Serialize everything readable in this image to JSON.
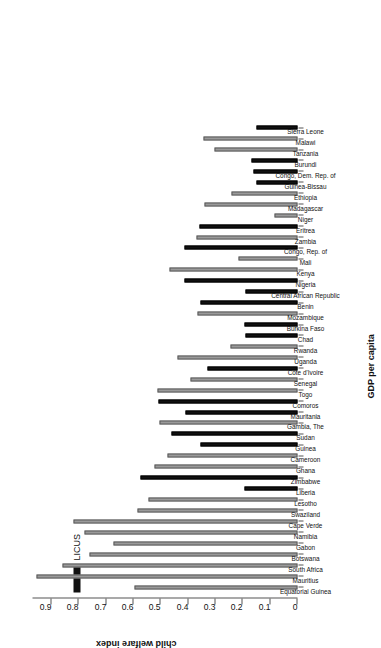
{
  "chart_data": {
    "type": "bar",
    "title": "",
    "xlabel": "GDP per capita",
    "ylabel": "child welfare index",
    "orientation": "vertical-bars-rotated-90",
    "ylim": [
      0,
      0.97
    ],
    "yticks": [
      "0",
      "0.1",
      "0.2",
      "0.3",
      "0.4",
      "0.5",
      "0.6",
      "0.7",
      "0.8",
      "0.9"
    ],
    "ytick_values": [
      0,
      0.1,
      0.2,
      0.3,
      0.4,
      0.5,
      0.6,
      0.7,
      0.8,
      0.9
    ],
    "grid": false,
    "legend": {
      "position": "bottom-right",
      "entries": [
        {
          "label": "LICUS",
          "color": "#111111"
        }
      ]
    },
    "colors": {
      "normal_bar": "#9a9a9a",
      "licus_bar": "#111111",
      "axis": "#555555",
      "text": "#111111"
    },
    "categories": [
      "Equatorial Guinea",
      "Mauritius",
      "South Africa",
      "Botswana",
      "Gabon",
      "Namibia",
      "Cape Verde",
      "Swaziland",
      "Lesotho",
      "Liberia",
      "Zimbabwe",
      "Ghana",
      "Cameroon",
      "Guinea",
      "Sudan",
      "Gambia, The",
      "Mauritania",
      "Comoros",
      "Togo",
      "Senegal",
      "Cote d'Ivoire",
      "Uganda",
      "Rwanda",
      "Chad",
      "Burkina Faso",
      "Mozambique",
      "Benin",
      "Central African Republic",
      "Nigeria",
      "Kenya",
      "Mali",
      "Congo, Rep. of",
      "Zambia",
      "Eritrea",
      "Niger",
      "Madagascar",
      "Ethiopia",
      "Guinea-Bissau",
      "Congo, Dem. Rep. of",
      "Burundi",
      "Tanzania",
      "Malawi",
      "Sierra Leone"
    ],
    "values": [
      0.595,
      0.955,
      0.86,
      0.76,
      0.675,
      0.78,
      0.82,
      0.585,
      0.545,
      0.195,
      0.575,
      0.525,
      0.475,
      0.355,
      0.46,
      0.505,
      0.41,
      0.508,
      0.513,
      0.39,
      0.33,
      0.44,
      0.245,
      0.19,
      0.195,
      0.365,
      0.355,
      0.192,
      0.415,
      0.47,
      0.215,
      0.415,
      0.37,
      0.36,
      0.085,
      0.34,
      0.24,
      0.15,
      0.16,
      0.168,
      0.305,
      0.345,
      0.15
    ],
    "licus_flags": [
      false,
      false,
      false,
      false,
      false,
      false,
      false,
      false,
      false,
      true,
      true,
      false,
      false,
      true,
      true,
      false,
      true,
      true,
      false,
      false,
      true,
      false,
      false,
      true,
      true,
      false,
      true,
      true,
      true,
      false,
      false,
      true,
      false,
      true,
      false,
      false,
      false,
      true,
      true,
      true,
      false,
      false,
      true
    ]
  }
}
